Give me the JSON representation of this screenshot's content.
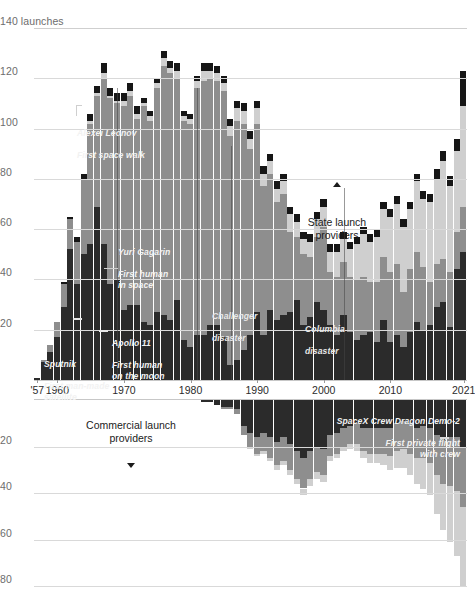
{
  "chart_data": {
    "type": "bar",
    "title": "",
    "subtitle": "",
    "xlabel": "",
    "ylabel": "launches",
    "grid": true,
    "legend_position": "inside",
    "panels": [
      {
        "name": "state",
        "label": "State launch providers",
        "direction": "up",
        "ylim": [
          0,
          140
        ],
        "yticks": [
          20,
          40,
          60,
          80,
          100,
          120,
          140
        ],
        "ytick_labels": [
          "20",
          "40",
          "60",
          "80",
          "100",
          "120",
          "140 launches"
        ]
      },
      {
        "name": "commercial",
        "label": "Commercial launch providers",
        "direction": "down",
        "ylim": [
          0,
          88
        ],
        "yticks": [
          20,
          40,
          60,
          80
        ],
        "ytick_labels": [
          "20",
          "40",
          "60",
          "80"
        ]
      }
    ],
    "x": [
      1957,
      1958,
      1959,
      1960,
      1961,
      1962,
      1963,
      1964,
      1965,
      1966,
      1967,
      1968,
      1969,
      1970,
      1971,
      1972,
      1973,
      1974,
      1975,
      1976,
      1977,
      1978,
      1979,
      1980,
      1981,
      1982,
      1983,
      1984,
      1985,
      1986,
      1987,
      1988,
      1989,
      1990,
      1991,
      1992,
      1993,
      1994,
      1995,
      1996,
      1997,
      1998,
      1999,
      2000,
      2001,
      2002,
      2003,
      2004,
      2005,
      2006,
      2007,
      2008,
      2009,
      2010,
      2011,
      2012,
      2013,
      2014,
      2015,
      2016,
      2017,
      2018,
      2019,
      2020,
      2021
    ],
    "xtick_labels": [
      "'57",
      "1960",
      "1970",
      "1980",
      "1990",
      "2000",
      "2010",
      "2021"
    ],
    "xtick_values": [
      1957,
      1960,
      1970,
      1980,
      1990,
      2000,
      2010,
      2021
    ],
    "series": [
      {
        "name": "USSR / Russia (state)",
        "panel": "state",
        "color": "#8e8e8e",
        "values": [
          0,
          1,
          3,
          6,
          9,
          12,
          17,
          30,
          48,
          44,
          66,
          74,
          70,
          81,
          83,
          74,
          86,
          81,
          89,
          99,
          98,
          88,
          87,
          89,
          98,
          101,
          98,
          97,
          98,
          91,
          95,
          90,
          74,
          75,
          59,
          54,
          47,
          48,
          32,
          25,
          28,
          24,
          26,
          33,
          21,
          23,
          21,
          22,
          24,
          23,
          20,
          24,
          25,
          28,
          28,
          22,
          25,
          28,
          25,
          17,
          17,
          17,
          22,
          15,
          18
        ]
      },
      {
        "name": "United States (state)",
        "panel": "state",
        "color": "#2b2b2b",
        "values": [
          1,
          7,
          11,
          17,
          29,
          52,
          38,
          50,
          54,
          69,
          54,
          38,
          40,
          28,
          30,
          30,
          23,
          22,
          27,
          26,
          24,
          32,
          16,
          13,
          18,
          18,
          22,
          22,
          17,
          6,
          8,
          12,
          18,
          27,
          18,
          28,
          24,
          26,
          27,
          32,
          22,
          25,
          31,
          28,
          22,
          18,
          26,
          19,
          16,
          18,
          19,
          15,
          24,
          15,
          18,
          13,
          19,
          23,
          20,
          22,
          29,
          31,
          21,
          44,
          51
        ]
      },
      {
        "name": "Other state",
        "panel": "state",
        "color": "#cfcfcf",
        "values": [
          0,
          0,
          0,
          0,
          0,
          0,
          0,
          0,
          1,
          1,
          2,
          1,
          1,
          2,
          2,
          2,
          1,
          2,
          2,
          3,
          2,
          3,
          2,
          2,
          3,
          4,
          3,
          3,
          3,
          4,
          5,
          5,
          4,
          6,
          5,
          5,
          5,
          5,
          7,
          6,
          6,
          6,
          7,
          8,
          8,
          10,
          9,
          11,
          14,
          17,
          16,
          18,
          19,
          22,
          24,
          26,
          24,
          28,
          27,
          32,
          34,
          39,
          34,
          32,
          40
        ]
      },
      {
        "name": "Unknown / other (state, hatched)",
        "panel": "state",
        "color": "#b5b5b5",
        "values": [
          0,
          0,
          0,
          0,
          1,
          1,
          2,
          2,
          3,
          3,
          4,
          3,
          3,
          3,
          3,
          3,
          2,
          2,
          2,
          3,
          3,
          3,
          2,
          2,
          2,
          3,
          3,
          3,
          3,
          3,
          3,
          3,
          3,
          3,
          3,
          3,
          3,
          3,
          3,
          3,
          3,
          3,
          3,
          3,
          3,
          3,
          3,
          3,
          3,
          3,
          3,
          3,
          3,
          3,
          3,
          3,
          3,
          3,
          3,
          3,
          4,
          4,
          4,
          5,
          14
        ]
      },
      {
        "name": "Commercial US",
        "panel": "commercial",
        "color": "#2b2b2b",
        "values": [
          0,
          0,
          0,
          0,
          0,
          0,
          0,
          0,
          0,
          0,
          0,
          0,
          0,
          0,
          0,
          0,
          0,
          0,
          0,
          0,
          0,
          0,
          0,
          0,
          0,
          1,
          1,
          2,
          3,
          3,
          4,
          11,
          14,
          16,
          14,
          16,
          18,
          16,
          19,
          22,
          25,
          22,
          20,
          21,
          15,
          14,
          12,
          11,
          10,
          12,
          12,
          12,
          12,
          12,
          10,
          9,
          10,
          12,
          11,
          12,
          15,
          17,
          16,
          16,
          20
        ]
      },
      {
        "name": "Commercial Europe / other",
        "panel": "commercial",
        "color": "#8e8e8e",
        "values": [
          0,
          0,
          0,
          0,
          0,
          0,
          0,
          0,
          0,
          0,
          0,
          0,
          0,
          0,
          0,
          0,
          0,
          0,
          0,
          0,
          0,
          0,
          0,
          0,
          0,
          0,
          0,
          0,
          1,
          1,
          2,
          4,
          6,
          7,
          8,
          9,
          10,
          10,
          11,
          12,
          13,
          12,
          11,
          11,
          9,
          9,
          8,
          8,
          9,
          10,
          11,
          11,
          11,
          12,
          12,
          12,
          13,
          13,
          14,
          15,
          17,
          19,
          21,
          23,
          26
        ]
      },
      {
        "name": "Commercial small / new",
        "panel": "commercial",
        "color": "#cfcfcf",
        "values": [
          0,
          0,
          0,
          0,
          0,
          0,
          0,
          0,
          0,
          0,
          0,
          0,
          0,
          0,
          0,
          0,
          0,
          0,
          0,
          0,
          0,
          0,
          0,
          0,
          0,
          0,
          0,
          0,
          0,
          0,
          0,
          0,
          1,
          1,
          1,
          1,
          2,
          2,
          2,
          2,
          3,
          3,
          3,
          3,
          2,
          2,
          2,
          2,
          3,
          3,
          4,
          4,
          5,
          6,
          7,
          8,
          9,
          11,
          13,
          14,
          17,
          20,
          24,
          28,
          34
        ]
      }
    ],
    "annotations": [
      {
        "id": "sputnik",
        "title": "Sputnik",
        "body": "First man-made\nsatellite",
        "year": 1957
      },
      {
        "id": "gagarin",
        "title": "Yuri Gagarin",
        "body": "First human\nin space",
        "year": 1961
      },
      {
        "id": "leonov",
        "title": "Alexei Leonov",
        "body": "First space walk",
        "year": 1965
      },
      {
        "id": "apollo11",
        "title": "Apollo 11",
        "body": "First human\non the moon",
        "year": 1969
      },
      {
        "id": "challenger",
        "title": "Challenger",
        "body": "disaster",
        "year": 1986
      },
      {
        "id": "columbia",
        "title": "Columbia",
        "body": "disaster",
        "year": 2003
      },
      {
        "id": "demo2",
        "title": "SpaceX Crew Dragon Demo-2",
        "body": "First private flight\nwith crew",
        "year": 2020
      }
    ]
  },
  "axes": {
    "state_yticks": [
      {
        "value": 140,
        "label": "140 launches"
      },
      {
        "value": 120,
        "label": "120"
      },
      {
        "value": 100,
        "label": "100"
      },
      {
        "value": 80,
        "label": "80"
      },
      {
        "value": 60,
        "label": "60"
      },
      {
        "value": 40,
        "label": "40"
      },
      {
        "value": 20,
        "label": "20"
      }
    ],
    "comm_yticks": [
      {
        "value": 20,
        "label": "20"
      },
      {
        "value": 40,
        "label": "40"
      },
      {
        "value": 60,
        "label": "60"
      },
      {
        "value": 80,
        "label": "80"
      }
    ],
    "xticks": [
      {
        "value": 1957,
        "label": "'57"
      },
      {
        "value": 1960,
        "label": "1960"
      },
      {
        "value": 1970,
        "label": "1970"
      },
      {
        "value": 1980,
        "label": "1980"
      },
      {
        "value": 1990,
        "label": "1990"
      },
      {
        "value": 2000,
        "label": "2000"
      },
      {
        "value": 2010,
        "label": "2010"
      },
      {
        "value": 2021,
        "label": "2021"
      }
    ]
  },
  "legends": {
    "state": "State launch\nproviders",
    "commercial": "Commercial launch\nproviders"
  },
  "annotations_text": {
    "sputnik_title": "Sputnik",
    "sputnik_body": "First man-made\nsatellite",
    "gagarin_title": "Yuri Gagarin",
    "gagarin_body": "First human\nin space",
    "leonov_title": "Alexei Leonov",
    "leonov_body": "First space walk",
    "apollo_title": "Apollo 11",
    "apollo_body": "First human\non the moon",
    "challenger_title": "Challenger",
    "challenger_body": "disaster",
    "columbia_title": "Columbia",
    "columbia_body": "disaster",
    "demo2_title": "SpaceX Crew Dragon Demo-2",
    "demo2_body": "First private flight\nwith crew"
  },
  "colors": {
    "ussr": "#8e8e8e",
    "usa": "#2b2b2b",
    "other": "#cfcfcf",
    "hatched": "#b5b5b5",
    "grid": "#d9d9d9",
    "text": "#1b1b1b",
    "muted": "#6d6d6d"
  }
}
